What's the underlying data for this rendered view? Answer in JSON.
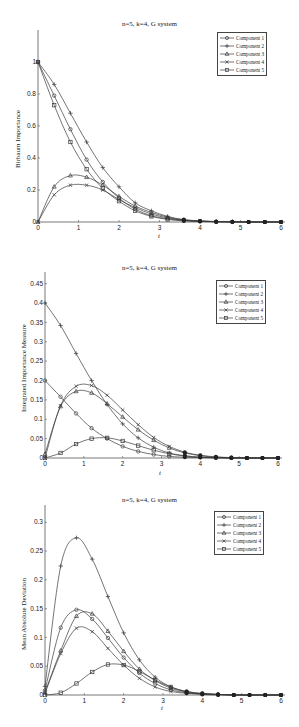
{
  "chart_data": [
    {
      "type": "line",
      "title": "n=5, k=4, G system",
      "xlabel": "t",
      "ylabel": "Birbaum Importance",
      "xlim": [
        0,
        6
      ],
      "ylim": [
        0,
        1.2
      ],
      "xticks": [
        0,
        1,
        2,
        3,
        4,
        5,
        6
      ],
      "yticks": [
        0,
        0.2,
        0.4,
        0.6,
        0.8,
        1
      ],
      "ytick_labels": [
        "0",
        "0.2",
        "0.4",
        "0.6",
        "0.8",
        "1"
      ],
      "grid": false,
      "legend_position": "upper right",
      "x": [
        0,
        0.4,
        0.8,
        1.2,
        1.6,
        2.0,
        2.4,
        2.8,
        3.2,
        3.6,
        4.0,
        4.4,
        4.8,
        5.2,
        5.6,
        6.0
      ],
      "series": [
        {
          "name": "Component 1",
          "marker": "circle",
          "values": [
            1.0,
            0.79,
            0.58,
            0.39,
            0.25,
            0.15,
            0.08,
            0.04,
            0.02,
            0.01,
            0.004,
            0.002,
            0.001,
            0.0,
            0.0,
            0.0
          ]
        },
        {
          "name": "Component 2",
          "marker": "plus",
          "values": [
            1.0,
            0.86,
            0.68,
            0.5,
            0.34,
            0.22,
            0.12,
            0.07,
            0.035,
            0.015,
            0.007,
            0.003,
            0.001,
            0.0,
            0.0,
            0.0
          ]
        },
        {
          "name": "Component 3",
          "marker": "triangle",
          "values": [
            0.0,
            0.22,
            0.29,
            0.28,
            0.23,
            0.16,
            0.1,
            0.06,
            0.03,
            0.013,
            0.006,
            0.002,
            0.001,
            0.0,
            0.0,
            0.0
          ]
        },
        {
          "name": "Component 4",
          "marker": "x",
          "values": [
            0.0,
            0.17,
            0.23,
            0.23,
            0.2,
            0.14,
            0.09,
            0.05,
            0.025,
            0.011,
            0.005,
            0.002,
            0.001,
            0.0,
            0.0,
            0.0
          ]
        },
        {
          "name": "Component 5",
          "marker": "square",
          "values": [
            1.0,
            0.73,
            0.5,
            0.33,
            0.21,
            0.13,
            0.07,
            0.035,
            0.016,
            0.007,
            0.003,
            0.001,
            0.0,
            0.0,
            0.0,
            0.0
          ]
        }
      ]
    },
    {
      "type": "line",
      "title": "n=5, k=4, G system",
      "xlabel": "t",
      "ylabel": "Integrated Importance Measure",
      "xlim": [
        0,
        6
      ],
      "ylim": [
        0,
        0.48
      ],
      "xticks": [
        0,
        1,
        2,
        3,
        4,
        5,
        6
      ],
      "yticks": [
        0,
        0.05,
        0.1,
        0.15,
        0.2,
        0.25,
        0.3,
        0.35,
        0.4,
        0.45
      ],
      "ytick_labels": [
        "0",
        "0.05",
        "0.1",
        "0.15",
        "0.2",
        "0.25",
        "0.3",
        "0.35",
        "0.4",
        "0.45"
      ],
      "grid": false,
      "legend_position": "upper right",
      "x": [
        0,
        0.4,
        0.8,
        1.2,
        1.6,
        2.0,
        2.4,
        2.8,
        3.2,
        3.6,
        4.0,
        4.4,
        4.8,
        5.2,
        5.6,
        6.0
      ],
      "series": [
        {
          "name": "Component 1",
          "marker": "circle",
          "values": [
            0.2,
            0.158,
            0.115,
            0.077,
            0.05,
            0.03,
            0.017,
            0.009,
            0.004,
            0.002,
            0.001,
            0.0,
            0.0,
            0.0,
            0.0,
            0.0
          ]
        },
        {
          "name": "Component 2",
          "marker": "plus",
          "values": [
            0.4,
            0.342,
            0.27,
            0.2,
            0.138,
            0.088,
            0.052,
            0.028,
            0.013,
            0.006,
            0.002,
            0.001,
            0.0,
            0.0,
            0.0,
            0.0
          ]
        },
        {
          "name": "Component 3",
          "marker": "triangle",
          "values": [
            0.01,
            0.133,
            0.172,
            0.168,
            0.14,
            0.106,
            0.073,
            0.046,
            0.026,
            0.013,
            0.006,
            0.002,
            0.001,
            0.0,
            0.0,
            0.0
          ]
        },
        {
          "name": "Component 4",
          "marker": "x",
          "values": [
            0.0,
            0.135,
            0.185,
            0.187,
            0.162,
            0.124,
            0.086,
            0.053,
            0.03,
            0.015,
            0.007,
            0.003,
            0.001,
            0.0,
            0.0,
            0.0
          ]
        },
        {
          "name": "Component 5",
          "marker": "square",
          "values": [
            0.0,
            0.013,
            0.036,
            0.05,
            0.052,
            0.044,
            0.032,
            0.02,
            0.011,
            0.005,
            0.002,
            0.001,
            0.0,
            0.0,
            0.0,
            0.0
          ]
        }
      ]
    },
    {
      "type": "line",
      "title": "n=5, k=4, G system",
      "xlabel": "t",
      "ylabel": "Mean Absolute Deviation",
      "xlim": [
        0,
        6
      ],
      "ylim": [
        0,
        0.33
      ],
      "xticks": [
        0,
        1,
        2,
        3,
        4,
        5,
        6
      ],
      "yticks": [
        0,
        0.05,
        0.1,
        0.15,
        0.2,
        0.25,
        0.3
      ],
      "ytick_labels": [
        "0",
        "0.05",
        "0.1",
        "0.15",
        "0.2",
        "0.25",
        "0.3"
      ],
      "grid": false,
      "legend_position": "upper right",
      "x": [
        0,
        0.4,
        0.8,
        1.2,
        1.6,
        2.0,
        2.4,
        2.8,
        3.2,
        3.6,
        4.0,
        4.4,
        4.8,
        5.2,
        5.6,
        6.0
      ],
      "series": [
        {
          "name": "Component 1",
          "marker": "circle",
          "values": [
            0.008,
            0.117,
            0.148,
            0.132,
            0.099,
            0.065,
            0.038,
            0.02,
            0.009,
            0.004,
            0.002,
            0.001,
            0.0,
            0.0,
            0.0,
            0.0
          ]
        },
        {
          "name": "Component 2",
          "marker": "plus",
          "values": [
            0.015,
            0.224,
            0.273,
            0.236,
            0.171,
            0.108,
            0.061,
            0.031,
            0.014,
            0.006,
            0.002,
            0.001,
            0.0,
            0.0,
            0.0,
            0.0
          ]
        },
        {
          "name": "Component 3",
          "marker": "triangle",
          "values": [
            0.005,
            0.077,
            0.137,
            0.141,
            0.111,
            0.076,
            0.045,
            0.025,
            0.012,
            0.005,
            0.002,
            0.001,
            0.0,
            0.0,
            0.0,
            0.0
          ]
        },
        {
          "name": "Component 4",
          "marker": "x",
          "values": [
            0.003,
            0.072,
            0.116,
            0.11,
            0.081,
            0.052,
            0.029,
            0.014,
            0.006,
            0.003,
            0.001,
            0.0,
            0.0,
            0.0,
            0.0,
            0.0
          ]
        },
        {
          "name": "Component 5",
          "marker": "square",
          "values": [
            0.0,
            0.004,
            0.02,
            0.04,
            0.053,
            0.052,
            0.041,
            0.026,
            0.014,
            0.006,
            0.003,
            0.001,
            0.0,
            0.0,
            0.0,
            0.0
          ]
        }
      ]
    }
  ],
  "figures": [
    {
      "title": "n=5, k=4, G system",
      "xlabel": "t",
      "ylabel": "Birbaum Importance"
    },
    {
      "title": "n=5, k=4, G system",
      "xlabel": "t",
      "ylabel": "Integrated Importance Measure"
    },
    {
      "title": "n=5, k=4, G system",
      "xlabel": "t",
      "ylabel": "Mean Absolute Deviation"
    }
  ],
  "legend": [
    "Component 1",
    "Component 2",
    "Component 3",
    "Component 4",
    "Component 5"
  ],
  "colors": {
    "line": "#3a3a3a",
    "axis": "#555555",
    "text": "#222222",
    "background": "#ffffff"
  }
}
